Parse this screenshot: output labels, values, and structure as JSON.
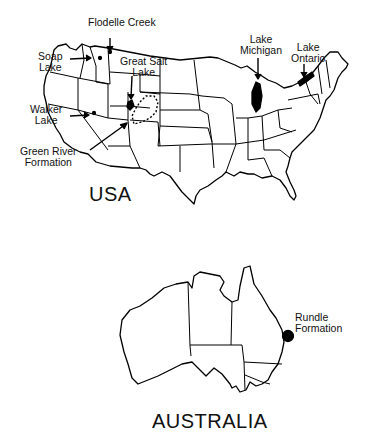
{
  "figure": {
    "usa": {
      "title": "USA",
      "sites": [
        {
          "id": "flodelle-creek",
          "line1": "Flodelle Creek",
          "line2": ""
        },
        {
          "id": "soap-lake",
          "line1": "Soap",
          "line2": "Lake"
        },
        {
          "id": "great-salt-lake",
          "line1": "Great Salt",
          "line2": "Lake"
        },
        {
          "id": "walker-lake",
          "line1": "Walker",
          "line2": "Lake"
        },
        {
          "id": "green-river-formation",
          "line1": "Green River",
          "line2": "Formation"
        },
        {
          "id": "lake-michigan",
          "line1": "Lake",
          "line2": "Michigan"
        },
        {
          "id": "lake-ontario",
          "line1": "Lake",
          "line2": "Ontario"
        }
      ]
    },
    "australia": {
      "title": "AUSTRALIA",
      "sites": [
        {
          "id": "rundle-formation",
          "line1": "Rundle",
          "line2": "Formation"
        }
      ]
    }
  }
}
